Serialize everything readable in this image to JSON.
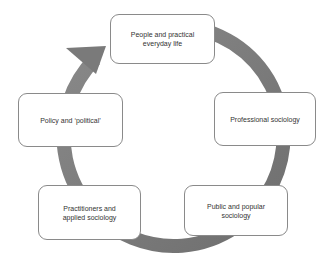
{
  "diagram": {
    "type": "cycle",
    "arrow_color": "#7a7a7a",
    "box_border_color": "#8a8a8a",
    "nodes": [
      {
        "id": "people",
        "label": "People and practical everyday life"
      },
      {
        "id": "professional",
        "label": "Professional sociology"
      },
      {
        "id": "public",
        "label": "Public and popular sociology"
      },
      {
        "id": "practitioners",
        "label": "Practitioners and applied sociology"
      },
      {
        "id": "policy",
        "label": "Policy and ‘political’"
      }
    ],
    "flow_direction": "clockwise, arrowhead pointing to 'People and practical everyday life' from 'Policy and political'"
  }
}
